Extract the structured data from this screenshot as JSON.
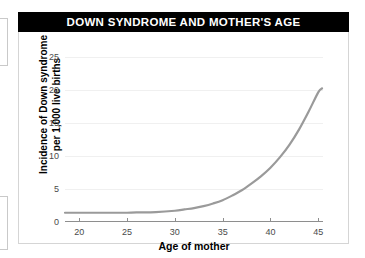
{
  "figure": {
    "title": "DOWN SYNDROME AND MOTHER'S AGE",
    "title_bar_color": "#000000",
    "title_text_color": "#ffffff",
    "border_color": "#d5d5d5"
  },
  "chart_data": {
    "type": "line",
    "title": "DOWN SYNDROME AND MOTHER'S AGE",
    "xlabel": "Age of mother",
    "ylabel": "Incidence of Down syndrome per 1,000 live births",
    "ylabel_line1": "Incidence of Down syndrome",
    "ylabel_line2": "per 1,000 live births",
    "xlim": [
      18.5,
      45.5
    ],
    "ylim": [
      0,
      26
    ],
    "xticks": [
      20,
      25,
      30,
      35,
      40,
      45
    ],
    "yticks": [
      0,
      5,
      10,
      15,
      20,
      25
    ],
    "xtick_labels": [
      "20",
      "25",
      "30",
      "35",
      "40",
      "45"
    ],
    "ytick_labels": [
      "0",
      "5",
      "10",
      "15",
      "20",
      "25"
    ],
    "grid": "horizontal-faint",
    "legend": "none",
    "series": [
      {
        "name": "Incidence of Down syndrome",
        "color": "#9a9a9a",
        "line_width": 2.2,
        "x": [
          18.5,
          20,
          22,
          24,
          25,
          26,
          28,
          30,
          31,
          32,
          33,
          34,
          35,
          36,
          37,
          38,
          39,
          40,
          41,
          42,
          43,
          44,
          45,
          45.4
        ],
        "values": [
          1.4,
          1.4,
          1.4,
          1.4,
          1.4,
          1.45,
          1.5,
          1.7,
          1.9,
          2.1,
          2.4,
          2.8,
          3.3,
          4.0,
          4.8,
          5.8,
          6.9,
          8.2,
          9.8,
          11.7,
          14.0,
          16.7,
          19.6,
          20.2
        ]
      }
    ]
  },
  "axis": {
    "axis_line_color": "#8e8e8e",
    "tick_text_color": "#4a4a4a"
  }
}
